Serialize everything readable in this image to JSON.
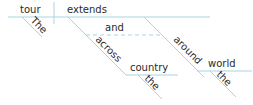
{
  "diagram": {
    "type": "sentence-diagram",
    "sentence": "The tour extends across the country and around the world",
    "line_color": "#a9d4e3",
    "text_color": "#2a2a2a",
    "words": {
      "subject": "tour",
      "verb": "extends",
      "subject_modifier": "The",
      "conjunction": "and",
      "prep1": "across",
      "prep1_object": "country",
      "prep1_object_modifier": "the",
      "prep2": "around",
      "prep2_object": "world",
      "prep2_object_modifier": "the"
    }
  }
}
